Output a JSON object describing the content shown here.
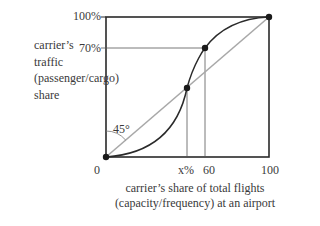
{
  "diagram": {
    "title": "",
    "y_axis": {
      "label_lines": [
        "carrier’s",
        "traffic",
        "(passenger/cargo)",
        "share"
      ],
      "ticks": [
        {
          "label": "100%",
          "value": 100
        },
        {
          "label": "70%",
          "value": 70
        }
      ]
    },
    "x_axis": {
      "label_lines": [
        "carrier’s share of total flights",
        "(capacity/frequency) at an airport"
      ],
      "ticks": [
        {
          "label": "0",
          "value": 0
        },
        {
          "label": "x%",
          "value": 46
        },
        {
          "label": "60",
          "value": 60
        },
        {
          "label": "100",
          "value": 100
        }
      ]
    },
    "angle_label": "45°",
    "colors": {
      "frame": "#2a2a2a",
      "diagonal": "#a8a8a8",
      "curve": "#2a2a2a",
      "guides": "#555555",
      "points": "#1a1a1a"
    },
    "elements": [
      {
        "type": "line",
        "name": "45-degree diagonal",
        "from": [
          0,
          0
        ],
        "to": [
          100,
          100
        ]
      },
      {
        "type": "curve",
        "name": "S-curve traffic vs capacity",
        "shape": "sigmoid",
        "from": [
          0,
          0
        ],
        "to": [
          100,
          100
        ]
      },
      {
        "type": "point",
        "at": [
          0,
          0
        ]
      },
      {
        "type": "point",
        "at": [
          46,
          46
        ],
        "note": "intersection of S-curve and diagonal"
      },
      {
        "type": "point",
        "at": [
          60,
          70
        ]
      },
      {
        "type": "point",
        "at": [
          100,
          100
        ]
      },
      {
        "type": "guide",
        "from": [
          60,
          0
        ],
        "to": [
          60,
          70
        ]
      },
      {
        "type": "guide",
        "from": [
          0,
          70
        ],
        "to": [
          60,
          70
        ]
      },
      {
        "type": "guide",
        "from": [
          46,
          0
        ],
        "to": [
          46,
          46
        ]
      }
    ]
  }
}
